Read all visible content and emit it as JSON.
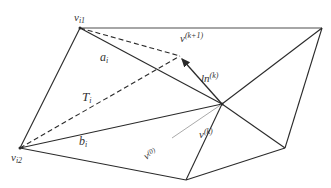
{
  "diagram": {
    "type": "triangle-mesh",
    "colors": {
      "edge": "#2a2a2a",
      "dashed": "#2a2a2a",
      "gray_line": "#aaaaaa",
      "label": "#333333"
    },
    "vertices": {
      "vi1": {
        "x": 80,
        "y": 28
      },
      "top_right": {
        "x": 322,
        "y": 28
      },
      "center": {
        "x": 222,
        "y": 104
      },
      "vi2": {
        "x": 20,
        "y": 148
      },
      "bottom_mid": {
        "x": 186,
        "y": 180
      },
      "right_bottom": {
        "x": 285,
        "y": 148
      },
      "vk1": {
        "x": 180,
        "y": 56
      },
      "v0": {
        "x": 172,
        "y": 138
      }
    },
    "labels": {
      "vi1": {
        "base": "v",
        "sub": "i1"
      },
      "vk1": {
        "base": "v",
        "sup": "(k+1)"
      },
      "ai": {
        "base": "a",
        "sub": "i"
      },
      "lnk": {
        "base": "ln",
        "sup": "(k)"
      },
      "Ti": {
        "base": "T",
        "sub": "i"
      },
      "vk": {
        "base": "v",
        "sup": "(k)"
      },
      "v0": {
        "base": "v",
        "sup": "(0)"
      },
      "bi": {
        "base": "b",
        "sub": "i"
      },
      "vi2": {
        "base": "v",
        "sub": "i2"
      }
    }
  }
}
